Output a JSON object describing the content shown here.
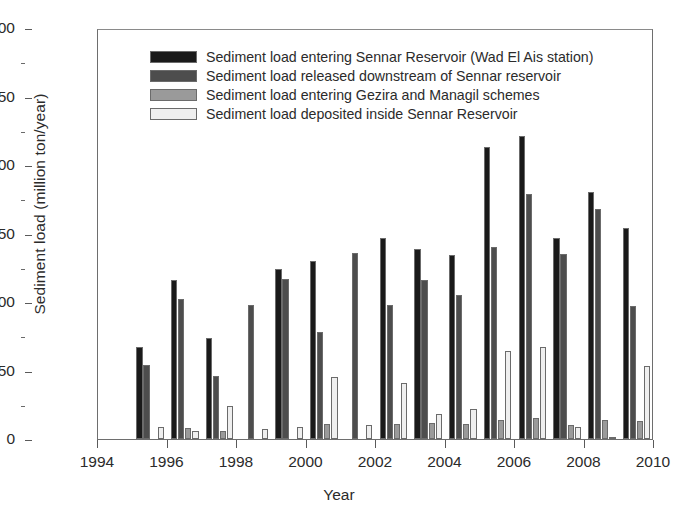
{
  "chart_data": {
    "type": "bar",
    "title": "",
    "xlabel": "Year",
    "ylabel": "Sediment load (million ton/year)",
    "categories": [
      1995,
      1996,
      1997,
      1998,
      1999,
      2000,
      2001,
      2002,
      2003,
      2004,
      2005,
      2006,
      2007,
      2008,
      2009
    ],
    "xlim": [
      1994,
      2010
    ],
    "ylim": [
      0,
      300
    ],
    "xticks": [
      "1994",
      "1996",
      "1998",
      "2000",
      "2002",
      "2004",
      "2006",
      "2008",
      "2010"
    ],
    "xtick_values": [
      1994,
      1996,
      1998,
      2000,
      2002,
      2004,
      2006,
      2008,
      2010
    ],
    "yticks": [
      "0",
      "50",
      "100",
      "150",
      "200",
      "250",
      "300"
    ],
    "ytick_values": [
      0,
      50,
      100,
      150,
      200,
      250,
      300
    ],
    "grid": false,
    "legend_position": "top-center",
    "series": [
      {
        "name": "Sediment load entering Sennar Reservoir (Wad El Ais station)",
        "color": "#1a1a1a",
        "values": [
          67,
          116,
          74,
          0,
          124,
          130,
          0,
          147,
          139,
          134,
          213,
          221,
          147,
          180,
          154
        ]
      },
      {
        "name": "Sediment load released downstream of Sennar reservoir",
        "color": "#4d4d4d",
        "values": [
          54,
          102,
          46,
          98,
          117,
          78,
          136,
          98,
          116,
          105,
          140,
          179,
          135,
          168,
          97
        ]
      },
      {
        "name": "Sediment load entering Gezira and Managil schemes",
        "color": "#9a9a9a",
        "values": [
          0,
          8,
          6,
          0,
          0,
          11,
          0,
          11,
          12,
          11,
          14,
          15,
          10,
          14,
          13
        ]
      },
      {
        "name": "Sediment load deposited inside Sennar Reservoir",
        "color": "#efefef",
        "values": [
          9,
          6,
          24,
          7,
          9,
          45,
          10,
          41,
          18,
          22,
          64,
          67,
          9,
          1,
          53
        ]
      }
    ]
  },
  "axis": {
    "ylabel": "Sediment load (million ton/year)",
    "xlabel": "Year"
  }
}
